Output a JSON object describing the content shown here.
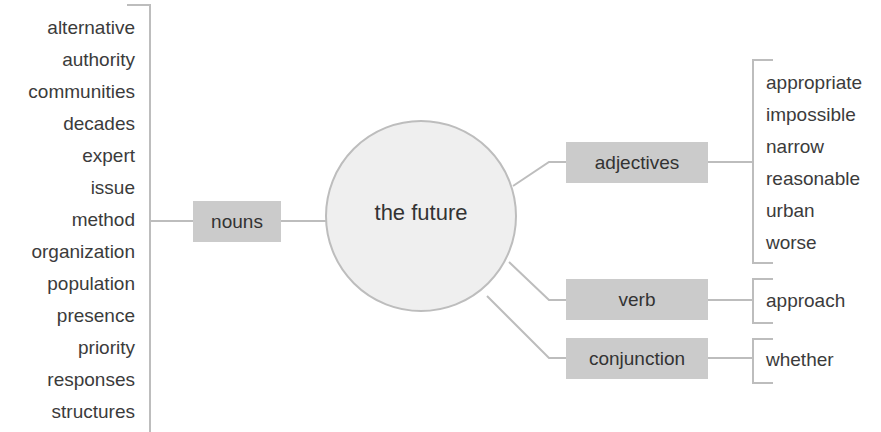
{
  "center": {
    "label": "the future"
  },
  "branches": {
    "nouns": {
      "label": "nouns",
      "words": [
        "alternative",
        "authority",
        "communities",
        "decades",
        "expert",
        "issue",
        "method",
        "organization",
        "population",
        "presence",
        "priority",
        "responses",
        "structures"
      ]
    },
    "adjectives": {
      "label": "adjectives",
      "words": [
        "appropriate",
        "impossible",
        "narrow",
        "reasonable",
        "urban",
        "worse"
      ]
    },
    "verb": {
      "label": "verb",
      "words": [
        "approach"
      ]
    },
    "conjunction": {
      "label": "conjunction",
      "words": [
        "whether"
      ]
    }
  },
  "colors": {
    "box_fill": "#cbcbcb",
    "circle_fill": "#efefef",
    "line": "#bdbdbd",
    "text": "#3a3a3a"
  }
}
